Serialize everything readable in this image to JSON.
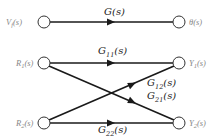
{
  "diagram": {
    "type": "signal-flow-graph",
    "colors": {
      "edge": "#1a1a1a",
      "node_stroke": "#333333",
      "signal_label": "#888888",
      "gain_label": "#222222",
      "background": "#ffffff"
    },
    "top_graph": {
      "input": {
        "base": "V",
        "sub": "f",
        "suffix": "(s)"
      },
      "output": {
        "text": "θ(s)"
      },
      "gain": {
        "text": "G(s)"
      }
    },
    "mimo_graph": {
      "inputs": [
        {
          "base": "R",
          "sub": "1",
          "suffix": "(s)"
        },
        {
          "base": "R",
          "sub": "2",
          "suffix": "(s)"
        }
      ],
      "outputs": [
        {
          "base": "Y",
          "sub": "1",
          "suffix": "(s)"
        },
        {
          "base": "Y",
          "sub": "2",
          "suffix": "(s)"
        }
      ],
      "gains": {
        "g11": {
          "base": "G",
          "sub": "11",
          "suffix": "(s)"
        },
        "g12": {
          "base": "G",
          "sub": "12",
          "suffix": "(s)"
        },
        "g21": {
          "base": "G",
          "sub": "21",
          "suffix": "(s)"
        },
        "g22": {
          "base": "G",
          "sub": "22",
          "suffix": "(s)"
        }
      }
    }
  }
}
